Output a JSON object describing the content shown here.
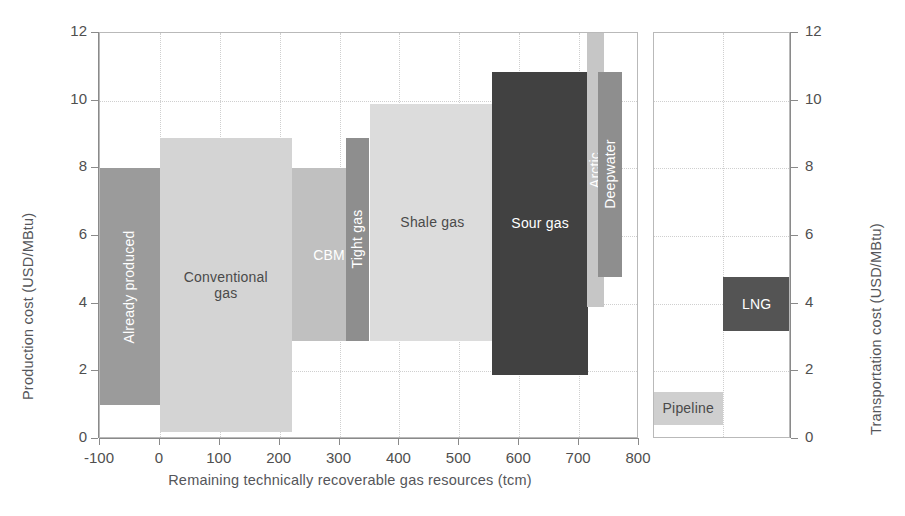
{
  "chart_data": {
    "type": "bar",
    "title": "",
    "subtitle": "",
    "xlabel": "Remaining technically recoverable gas resources (tcm)",
    "ylabel": "Production cost (USD/MBtu)",
    "ylabel_right": "Transportation cost (USD/MBtu)",
    "xlim": [
      -100,
      800
    ],
    "ylim": [
      0,
      12
    ],
    "xticks": [
      -100,
      0,
      100,
      200,
      300,
      400,
      500,
      600,
      700,
      800
    ],
    "yticks": [
      0,
      2,
      4,
      6,
      8,
      10,
      12
    ],
    "xtick_labels": [
      "-100",
      "0",
      "100",
      "200",
      "300",
      "400",
      "500",
      "600",
      "700",
      "800"
    ],
    "ytick_labels": [
      "0",
      "2",
      "4",
      "6",
      "8",
      "10",
      "12"
    ],
    "ytick_labels_right": [
      "0",
      "2",
      "4",
      "6",
      "8",
      "10",
      "12"
    ],
    "grid": true,
    "legend": "none",
    "orientation": "cost-supply-curve",
    "panels": [
      {
        "name": "production-cost-panel",
        "axis": "left",
        "x_unit": "tcm",
        "y_unit": "USD/MBtu",
        "bars": [
          {
            "label": "Already produced",
            "x_start": -100,
            "x_end": 0,
            "cost_min": 1.0,
            "cost_max": 8.0,
            "color": "#9b9b9b",
            "text_color": "#ffffff",
            "label_rotated": true
          },
          {
            "label": "Conventional\ngas",
            "x_start": 0,
            "x_end": 220,
            "cost_min": 0.2,
            "cost_max": 8.9,
            "color": "#d4d4d4",
            "text_color": "#4a4a4a",
            "label_rotated": false
          },
          {
            "label": "CBM",
            "x_start": 220,
            "x_end": 345,
            "cost_min": 2.9,
            "cost_max": 8.0,
            "color": "#c0c0c0",
            "text_color": "#ffffff",
            "label_rotated": false
          },
          {
            "label": "Tight gas",
            "x_start": 310,
            "x_end": 350,
            "cost_min": 2.9,
            "cost_max": 8.9,
            "color": "#8e8e8e",
            "text_color": "#ffffff",
            "label_rotated": true
          },
          {
            "label": "Shale gas",
            "x_start": 350,
            "x_end": 560,
            "cost_min": 2.9,
            "cost_max": 9.9,
            "color": "#dcdcdc",
            "text_color": "#4a4a4a",
            "label_rotated": false
          },
          {
            "label": "Sour gas",
            "x_start": 555,
            "x_end": 715,
            "cost_min": 1.9,
            "cost_max": 10.85,
            "color": "#414141",
            "text_color": "#ffffff",
            "label_rotated": false
          },
          {
            "label": "Arctic",
            "x_start": 713,
            "x_end": 741,
            "cost_min": 3.9,
            "cost_max": 12.0,
            "color": "#c6c6c6",
            "text_color": "#ffffff",
            "label_rotated": true
          },
          {
            "label": "Deepwater",
            "x_start": 731,
            "x_end": 772,
            "cost_min": 4.8,
            "cost_max": 10.85,
            "color": "#8e8e8e",
            "text_color": "#ffffff",
            "label_rotated": true
          }
        ]
      },
      {
        "name": "transportation-cost-panel",
        "axis": "right",
        "y_unit": "USD/MBtu",
        "bars": [
          {
            "label": "Pipeline",
            "slot_start": 0.0,
            "slot_end": 0.5,
            "cost_min": 0.4,
            "cost_max": 1.4,
            "color": "#cfcfcf",
            "text_color": "#4a4a4a",
            "label_rotated": false
          },
          {
            "label": "LNG",
            "slot_start": 0.5,
            "slot_end": 1.0,
            "cost_min": 3.2,
            "cost_max": 4.8,
            "color": "#545454",
            "text_color": "#ffffff",
            "label_rotated": false
          }
        ]
      }
    ]
  }
}
